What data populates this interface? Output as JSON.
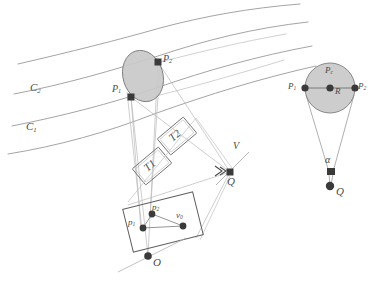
{
  "figure": {
    "background_color": "#ffffff",
    "line_color": "#8a8a8a",
    "dark_marker_color": "#3a3a3a",
    "fill_gray": "#c9c9c9",
    "label_color": "#4a4a4a"
  },
  "left_panel": {
    "name": "perspective-projection-diagram",
    "curves": [
      {
        "id": "c1",
        "label": "C",
        "subscript": "1",
        "role": "lower-lane-boundary"
      },
      {
        "id": "c2",
        "label": "C",
        "subscript": "2",
        "role": "upper-lane-boundary"
      }
    ],
    "curve_labels": [
      {
        "text": "C",
        "sub": "2",
        "x": 30,
        "y": 88
      },
      {
        "text": "C",
        "sub": "1",
        "x": 26,
        "y": 127
      }
    ],
    "ellipse": {
      "name": "target-ellipse",
      "cx": 143,
      "cy": 76,
      "rx": 20,
      "ry": 26,
      "rotation_deg": -16,
      "fill": "#c9c9c9",
      "stroke": "#7d7d7d"
    },
    "world_points": [
      {
        "id": "P1",
        "label": "P",
        "sub": "1",
        "x": 131,
        "y": 97,
        "label_x": 114,
        "label_y": 88,
        "marker": "square"
      },
      {
        "id": "P2",
        "label": "P",
        "sub": "2",
        "x": 158,
        "y": 62,
        "label_x": 163,
        "label_y": 57,
        "marker": "square"
      }
    ],
    "planes": [
      {
        "id": "T2",
        "label": "T2",
        "cx": 177,
        "cy": 136,
        "w": 34,
        "h": 21,
        "rotation_deg": -40
      },
      {
        "id": "T1",
        "label": "T1",
        "cx": 152,
        "cy": 166,
        "w": 34,
        "h": 21,
        "rotation_deg": -40
      }
    ],
    "view_point": {
      "id": "V",
      "label": "V",
      "x": 236,
      "y": 163,
      "label_x": 233,
      "label_y": 146
    },
    "q_point": {
      "id": "Q",
      "label": "Q",
      "x": 230,
      "y": 172,
      "label_x": 228,
      "label_y": 176,
      "marker": "square"
    },
    "image_plane": {
      "name": "image-plane-rect",
      "cx": 163,
      "cy": 222,
      "w": 72,
      "h": 44,
      "rotation_deg": -14
    },
    "image_points": [
      {
        "id": "p1",
        "label": "p",
        "sub": "1",
        "x": 143,
        "y": 228,
        "label_x": 129,
        "label_y": 222,
        "marker": "dot"
      },
      {
        "id": "p2",
        "label": "p",
        "sub": "2",
        "x": 152,
        "y": 214,
        "label_x": 153,
        "label_y": 205,
        "marker": "dot"
      },
      {
        "id": "v0",
        "label": "v",
        "sub": "0",
        "x": 183,
        "y": 226,
        "label_x": 177,
        "label_y": 213,
        "marker": "dot"
      }
    ],
    "optical_center": {
      "id": "O",
      "label": "O",
      "x": 148,
      "y": 256,
      "label_x": 153,
      "label_y": 259,
      "marker": "dot"
    }
  },
  "right_panel": {
    "name": "top-down-circle-detail",
    "circle": {
      "name": "target-circle",
      "cx": 330,
      "cy": 88,
      "r": 25,
      "fill": "#c9c9c9",
      "stroke": "#7d7d7d"
    },
    "center_point": {
      "id": "Pc",
      "label": "P",
      "sub": "c",
      "x": 330,
      "y": 88,
      "label_x": 327,
      "label_y": 70,
      "marker": "dot"
    },
    "radius_label": {
      "text": "R",
      "x": 336,
      "y": 90
    },
    "edge_points": [
      {
        "id": "P1r",
        "label": "P",
        "sub": "1",
        "x": 305,
        "y": 88,
        "label_x": 290,
        "label_y": 84,
        "marker": "dot"
      },
      {
        "id": "P2r",
        "label": "P",
        "sub": "2",
        "x": 355,
        "y": 88,
        "label_x": 358,
        "label_y": 84,
        "marker": "dot"
      }
    ],
    "angle_label": {
      "text": "α",
      "x": 327,
      "y": 160
    },
    "apex_marker": {
      "id": "alpha-vertex",
      "x": 331,
      "y": 173,
      "marker": "square"
    },
    "q_point": {
      "id": "Qr",
      "label": "Q",
      "x": 330,
      "y": 186,
      "label_x": 336,
      "label_y": 190,
      "marker": "dot"
    }
  }
}
